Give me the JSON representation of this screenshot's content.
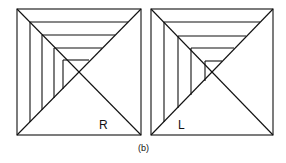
{
  "figure": {
    "caption": "(b)",
    "panels": [
      {
        "label": "R",
        "x0": 17,
        "y0": 9,
        "x1": 141,
        "y1": 135
      },
      {
        "label": "L",
        "x0": 151,
        "y0": 9,
        "x1": 273,
        "y1": 135
      }
    ],
    "stroke_color": "#111111",
    "background": "#ffffff"
  }
}
